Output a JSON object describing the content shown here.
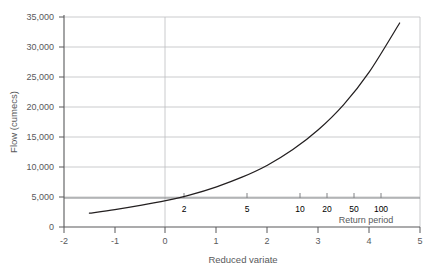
{
  "chart_data": {
    "type": "line",
    "title": "",
    "xlabel": "Reduced variate",
    "ylabel": "Flow (cumecs)",
    "xlim": [
      -2,
      5
    ],
    "ylim": [
      0,
      35000
    ],
    "grid": true,
    "legend": null,
    "x_ticks": [
      "-2",
      "-1",
      "0",
      "1",
      "2",
      "3",
      "4",
      "5"
    ],
    "x_tick_values": [
      -2,
      -1,
      0,
      1,
      2,
      3,
      4,
      5
    ],
    "y_ticks": [
      "0",
      "5,000",
      "10,000",
      "15,000",
      "20,000",
      "25,000",
      "30,000",
      "35,000"
    ],
    "y_tick_values": [
      0,
      5000,
      10000,
      15000,
      20000,
      25000,
      30000,
      35000
    ],
    "secondary_axis": {
      "label": "Return period",
      "ticks": [
        "2",
        "5",
        "10",
        "20",
        "50",
        "100"
      ],
      "tick_values": [
        2,
        5,
        10,
        20,
        50,
        100
      ],
      "tick_reduced_variate": [
        0.367,
        1.5,
        2.25,
        2.97,
        3.9,
        4.6
      ]
    },
    "series": [
      {
        "name": "Flow frequency curve",
        "x": [
          -1.5,
          -1.0,
          -0.5,
          0.0,
          0.5,
          1.0,
          1.5,
          2.0,
          2.5,
          3.0,
          3.5,
          4.0,
          4.6
        ],
        "values": [
          2300,
          2900,
          3600,
          4400,
          5400,
          6700,
          8300,
          10300,
          12900,
          16200,
          20400,
          25800,
          34000
        ]
      }
    ]
  }
}
